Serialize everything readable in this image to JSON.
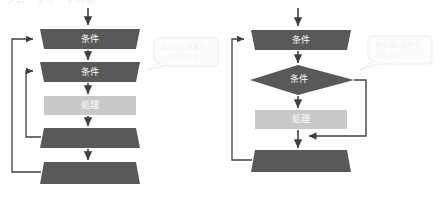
{
  "heading": {
    "clipped_text": "フローチャートの例"
  },
  "colors": {
    "shape_dark": "#595959",
    "shape_light": "#c9c9c9",
    "shape_label": "#ffffff",
    "connector": "#404040",
    "callout_fill": "#fcfcfc",
    "callout_stroke": "#ededed",
    "callout_text": "#f2f2f2",
    "background": "#ffffff"
  },
  "diagrams": [
    {
      "id": "diagram-left",
      "name": "nested-loop-flowchart",
      "nodes": [
        {
          "id": "loop-start-outer",
          "label": "条件",
          "shape": "loop-start-trapezoid",
          "fill": "#595959"
        },
        {
          "id": "loop-start-inner",
          "label": "条件",
          "shape": "loop-start-trapezoid",
          "fill": "#595959"
        },
        {
          "id": "process",
          "label": "処理",
          "shape": "rectangle",
          "fill": "#c9c9c9"
        },
        {
          "id": "loop-end-inner",
          "label": "",
          "shape": "loop-end-trapezoid",
          "fill": "#595959"
        },
        {
          "id": "loop-end-outer",
          "label": "",
          "shape": "loop-end-trapezoid",
          "fill": "#595959"
        }
      ],
      "callout": {
        "line1": "繰り返し処理を",
        "line2": "入れ子にする"
      }
    },
    {
      "id": "diagram-right",
      "name": "loop-with-branch-flowchart",
      "nodes": [
        {
          "id": "loop-start",
          "label": "条件",
          "shape": "loop-start-trapezoid",
          "fill": "#595959"
        },
        {
          "id": "decision",
          "label": "条件",
          "shape": "diamond",
          "fill": "#595959"
        },
        {
          "id": "process",
          "label": "処理",
          "shape": "rectangle",
          "fill": "#c9c9c9"
        },
        {
          "id": "loop-end",
          "label": "",
          "shape": "loop-end-trapezoid",
          "fill": "#595959"
        }
      ],
      "callout": {
        "line1": "繰り返しの中で",
        "line2": "分岐する"
      }
    }
  ]
}
